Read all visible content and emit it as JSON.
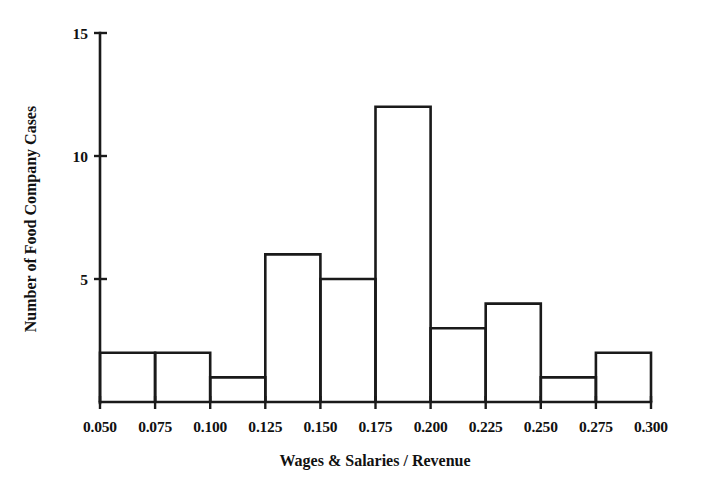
{
  "figure": {
    "background_color": "#ffffff",
    "ink_color": "#1a1a1a",
    "width": 709,
    "height": 496
  },
  "chart_data": {
    "type": "bar",
    "subtype": "histogram",
    "title": "",
    "xlabel": "Wages & Salaries / Revenue",
    "ylabel": "Number of Food Company Cases",
    "categories": [
      "0.050-0.075",
      "0.075-0.100",
      "0.100-0.125",
      "0.125-0.150",
      "0.150-0.175",
      "0.175-0.200",
      "0.200-0.225",
      "0.225-0.250",
      "0.250-0.275",
      "0.275-0.300"
    ],
    "bin_edges": [
      0.05,
      0.075,
      0.1,
      0.125,
      0.15,
      0.175,
      0.2,
      0.225,
      0.25,
      0.275,
      0.3
    ],
    "values": [
      2,
      2,
      1,
      6,
      5,
      12,
      3,
      4,
      1,
      2
    ],
    "bin_width": 0.025,
    "total_count": 38,
    "xlim": [
      0.05,
      0.3
    ],
    "ylim": [
      0,
      15
    ],
    "xticks": [
      "0.050",
      "0.075",
      "0.100",
      "0.125",
      "0.150",
      "0.175",
      "0.200",
      "0.225",
      "0.250",
      "0.275",
      "0.300"
    ],
    "xtick_values": [
      0.05,
      0.075,
      0.1,
      0.125,
      0.15,
      0.175,
      0.2,
      0.225,
      0.25,
      0.275,
      0.3
    ],
    "yticks": [
      "5",
      "10",
      "15"
    ],
    "ytick_values": [
      5,
      10,
      15
    ],
    "grid": false,
    "legend": false,
    "bar_style": "outline-only",
    "bar_fill": "none",
    "bar_stroke": "#1a1a1a"
  }
}
